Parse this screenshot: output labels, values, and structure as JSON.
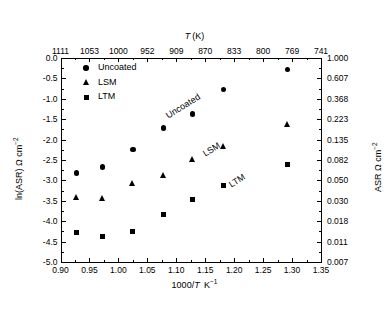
{
  "chart_data": {
    "type": "scatter",
    "title": "",
    "xlabel": "1000/T K⁻¹",
    "ylabel": "ln(ASR) Ω cm⁻²",
    "y2label": "ASR Ω cm⁻²",
    "x2label": "T (K)",
    "xlim": [
      0.9,
      1.35
    ],
    "ylim": [
      -5.0,
      0.0
    ],
    "grid": false,
    "legend_position": "upper-left-inside",
    "xticks": [
      "0.90",
      "0.95",
      "1.00",
      "1.05",
      "1.10",
      "1.15",
      "1.20",
      "1.25",
      "1.30",
      "1.35"
    ],
    "xtick_values": [
      0.9,
      0.95,
      1.0,
      1.05,
      1.1,
      1.15,
      1.2,
      1.25,
      1.3,
      1.35
    ],
    "yticks": [
      "0.0",
      "-0.5",
      "-1.0",
      "-1.5",
      "-2.0",
      "-2.5",
      "-3.0",
      "-3.5",
      "-4.0",
      "-4.5",
      "-5.0"
    ],
    "ytick_values": [
      0.0,
      -0.5,
      -1.0,
      -1.5,
      -2.0,
      -2.5,
      -3.0,
      -3.5,
      -4.0,
      -4.5,
      -5.0
    ],
    "y2ticks": [
      "1.000",
      "0.607",
      "0.368",
      "0.223",
      "0.135",
      "0.082",
      "0.050",
      "0.030",
      "0.018",
      "0.011",
      "0.007"
    ],
    "x2ticks": [
      "1111",
      "1053",
      "1000",
      "952",
      "909",
      "870",
      "833",
      "800",
      "769",
      "741"
    ],
    "x2tick_values": [
      0.9,
      0.95,
      1.0,
      1.05,
      1.1,
      1.15,
      1.2,
      1.25,
      1.3,
      1.35
    ],
    "annotations": [
      {
        "text": "Uncoated",
        "x": 1.078,
        "y": -1.32,
        "rotation": -32
      },
      {
        "text": "LSM",
        "x": 1.142,
        "y": -2.26,
        "rotation": -32
      },
      {
        "text": "LTM",
        "x": 1.188,
        "y": -3.02,
        "rotation": -32
      }
    ],
    "series": [
      {
        "name": "Uncoated",
        "marker": "circle",
        "color": "#000000",
        "x": [
          0.928,
          0.973,
          1.025,
          1.078,
          1.128,
          1.182,
          1.292
        ],
        "y": [
          -2.82,
          -2.67,
          -2.25,
          -1.72,
          -1.37,
          -0.77,
          -0.28
        ]
      },
      {
        "name": "LSM",
        "marker": "triangle",
        "color": "#000000",
        "x": [
          0.928,
          0.973,
          1.025,
          1.078,
          1.128,
          1.182,
          1.292
        ],
        "y": [
          -3.42,
          -3.43,
          -3.07,
          -2.88,
          -2.48,
          -2.17,
          -1.62
        ]
      },
      {
        "name": "LTM",
        "marker": "square",
        "color": "#000000",
        "x": [
          0.928,
          0.973,
          1.025,
          1.078,
          1.128,
          1.182,
          1.292
        ],
        "y": [
          -4.27,
          -4.37,
          -4.25,
          -3.83,
          -3.48,
          -3.12,
          -2.62
        ]
      }
    ]
  },
  "legend": {
    "items": [
      {
        "label": "Uncoated",
        "marker": "circle"
      },
      {
        "label": "LSM",
        "marker": "triangle"
      },
      {
        "label": "LTM",
        "marker": "square"
      }
    ]
  },
  "axes": {
    "x_bottom_title_main": "1000/",
    "x_bottom_title_italic": "T",
    "x_bottom_title_unit": "K",
    "x_bottom_title_sup": "−1",
    "x_top_title_italic": "T",
    "x_top_title_unit": "(K)",
    "y_left_title": "ln(ASR) Ω cm",
    "y_left_title_sup": "−2",
    "y_right_title": "ASR Ω cm",
    "y_right_title_sup": "−2"
  }
}
